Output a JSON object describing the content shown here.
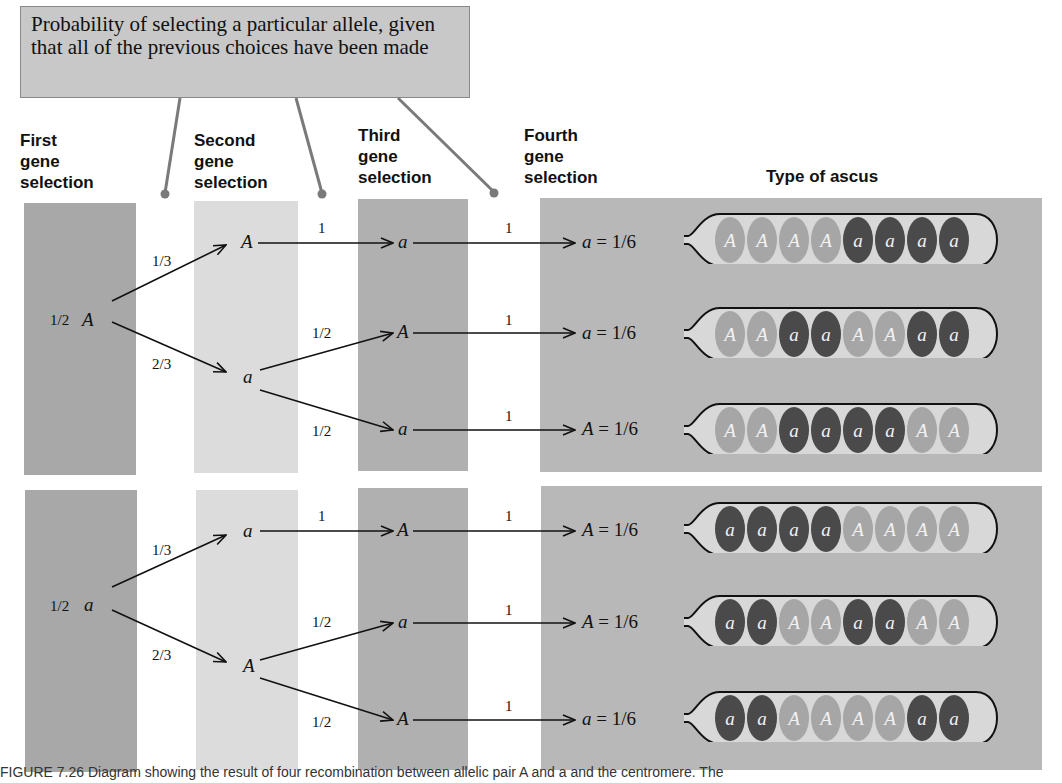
{
  "callout": {
    "text": "Probability of selecting a particular allele, given that all of the previous choices have been made"
  },
  "headers": {
    "first": [
      "First",
      "gene",
      "selection"
    ],
    "second": [
      "Second",
      "gene",
      "selection"
    ],
    "third": [
      "Third",
      "gene",
      "selection"
    ],
    "fourth": [
      "Fourth",
      "gene",
      "selection"
    ],
    "ascus": "Type of ascus"
  },
  "top_tree": {
    "root": {
      "prob": "1/2",
      "allele": "A"
    },
    "second": [
      {
        "prob": "1/3",
        "allele": "A"
      },
      {
        "prob": "2/3",
        "allele": "a"
      }
    ],
    "third": [
      {
        "prob": "1",
        "allele": "a"
      },
      {
        "prob": "1/2",
        "allele": "A"
      },
      {
        "prob": "1/2",
        "allele": "a"
      }
    ],
    "fourth": [
      {
        "prob": "1",
        "allele": "a",
        "result": "1/6"
      },
      {
        "prob": "1",
        "allele": "a",
        "result": "1/6"
      },
      {
        "prob": "1",
        "allele": "A",
        "result": "1/6"
      }
    ]
  },
  "bottom_tree": {
    "root": {
      "prob": "1/2",
      "allele": "a"
    },
    "second": [
      {
        "prob": "1/3",
        "allele": "a"
      },
      {
        "prob": "2/3",
        "allele": "A"
      }
    ],
    "third": [
      {
        "prob": "1",
        "allele": "A"
      },
      {
        "prob": "1/2",
        "allele": "a"
      },
      {
        "prob": "1/2",
        "allele": "A"
      }
    ],
    "fourth": [
      {
        "prob": "1",
        "allele": "A",
        "result": "1/6"
      },
      {
        "prob": "1",
        "allele": "A",
        "result": "1/6"
      },
      {
        "prob": "1",
        "allele": "a",
        "result": "1/6"
      }
    ]
  },
  "asci": [
    [
      "A",
      "A",
      "A",
      "A",
      "a",
      "a",
      "a",
      "a"
    ],
    [
      "A",
      "A",
      "a",
      "a",
      "A",
      "A",
      "a",
      "a"
    ],
    [
      "A",
      "A",
      "a",
      "a",
      "a",
      "a",
      "A",
      "A"
    ],
    [
      "a",
      "a",
      "a",
      "a",
      "A",
      "A",
      "A",
      "A"
    ],
    [
      "a",
      "a",
      "A",
      "A",
      "a",
      "a",
      "A",
      "A"
    ],
    [
      "a",
      "a",
      "A",
      "A",
      "A",
      "A",
      "a",
      "a"
    ]
  ],
  "colors": {
    "spore_A": "#a6a6a6",
    "spore_a": "#4a4a4a",
    "ascus_fill": "#d8d8d8",
    "callout_bg": "#c8c8c8",
    "callout_line": "#777777"
  },
  "caption": "FIGURE 7.26  Diagram showing the result of four recombination between allelic pair A and a and the centromere. The"
}
